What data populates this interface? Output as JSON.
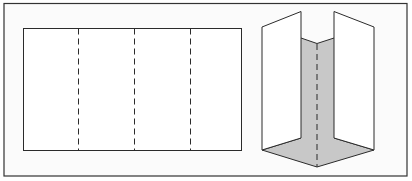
{
  "figure": {
    "background": "#fbfbfb",
    "frame_color": "#333333",
    "line_color": "#2b2b2b",
    "fold_fill": "#c8c8c8",
    "panel_fill": "#ffffff"
  },
  "flat_sheet": {
    "panels": 4,
    "fold_lines": 3,
    "fold_style": "dashed"
  },
  "folded_sheet": {
    "fold_style": "dashed",
    "view": "isometric folded zigzag"
  }
}
